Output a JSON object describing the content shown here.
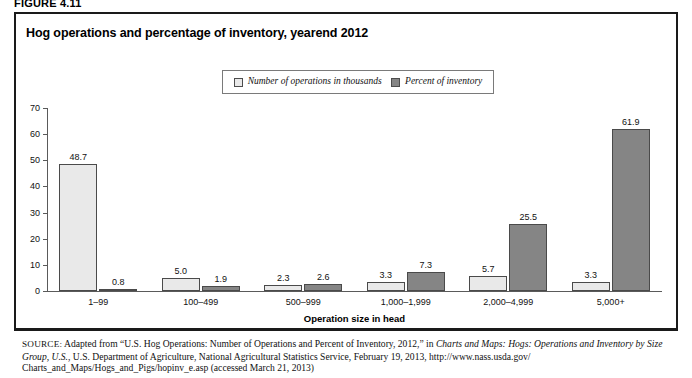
{
  "figure": {
    "number_label": "FIGURE 4.11",
    "title": "Hog operations and percentage of inventory, yearend 2012"
  },
  "legend": {
    "items": [
      {
        "label": "Number of operations in thousands",
        "swatch": "light-square-icon",
        "color": "#e9e9e9"
      },
      {
        "label": "Percent of inventory",
        "swatch": "dark-square-icon",
        "color": "#858585"
      }
    ]
  },
  "axes": {
    "y_ticks": [
      "0",
      "10",
      "20",
      "30",
      "40",
      "50",
      "60",
      "70"
    ],
    "x_axis_title": "Operation size in head"
  },
  "source": {
    "prefix": "SOURCE:",
    "line_1_a": " Adapted from “U.S. Hog Operations: Number of Operations and Percent of Inventory, 2012,” in ",
    "line_1_italic": "Charts and Maps: Hogs: Operations and",
    "line_2_italic": "Inventory by Size Group, U.S.",
    "line_2_rest": ", U.S. Department of Agriculture, National Agricultural Statistics Service, February 19, 2013, http://www.nass.usda.gov/",
    "line_3": "Charts_and_Maps/Hogs_and_Pigs/hopinv_e.asp (accessed March 21, 2013)"
  },
  "chart_data": {
    "type": "bar",
    "title": "Hog operations and percentage of inventory, yearend 2012",
    "xlabel": "Operation size in head",
    "ylabel": "",
    "ylim": [
      0,
      70
    ],
    "ytick_step": 10,
    "grid": false,
    "legend_position": "top-center",
    "categories": [
      "1–99",
      "100–499",
      "500–999",
      "1,000–1,999",
      "2,000–4,999",
      "5,000+"
    ],
    "series": [
      {
        "name": "Number of operations in thousands",
        "color": "#e9e9e9",
        "values": [
          48.7,
          5.0,
          2.3,
          3.3,
          5.7,
          3.3
        ],
        "labels": [
          "48.7",
          "5.0",
          "2.3",
          "3.3",
          "5.7",
          "3.3"
        ]
      },
      {
        "name": "Percent of inventory",
        "color": "#858585",
        "values": [
          0.8,
          1.9,
          2.6,
          7.3,
          25.5,
          61.9
        ],
        "labels": [
          "0.8",
          "1.9",
          "2.6",
          "7.3",
          "25.5",
          "61.9"
        ]
      }
    ]
  }
}
